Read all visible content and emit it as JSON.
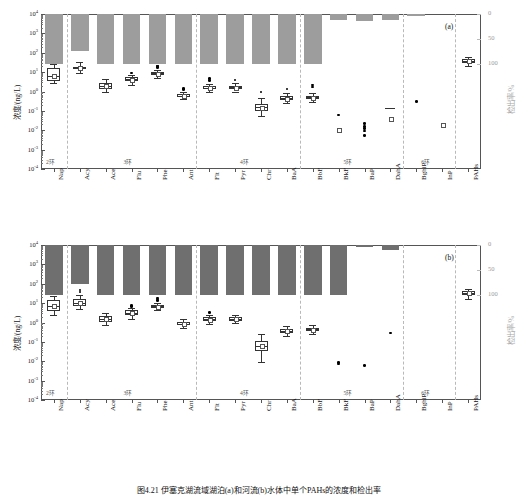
{
  "figure": {
    "caption": "图4.21  伊塞克湖流域湖泊(a)和河流(b)水体中单个PAHs的浓度和检出率",
    "panel_a_id": "(a)",
    "panel_b_id": "(b)"
  },
  "axes": {
    "left_title": "浓度/(ng/L)",
    "right_title": "检出率/%",
    "left_ticks": [
      "10",
      "10",
      "10",
      "10",
      "10",
      "10",
      "10",
      "10",
      "10"
    ],
    "left_exponents": [
      "4",
      "3",
      "2",
      "1",
      "0",
      "-1",
      "-2",
      "-3",
      "-4"
    ],
    "right_ticks": [
      "0",
      "50",
      "100"
    ],
    "right_values": [
      0,
      50,
      100
    ]
  },
  "groups": [
    {
      "label": "2环",
      "count": 1
    },
    {
      "label": "3环",
      "count": 5
    },
    {
      "label": "4环",
      "count": 4
    },
    {
      "label": "5环",
      "count": 4
    },
    {
      "label": "6环",
      "count": 2
    }
  ],
  "categories": [
    "Nap",
    "Acy",
    "Ace",
    "Flu",
    "Phe",
    "Ant",
    "Flt",
    "Pyr",
    "Chr",
    "BaA",
    "BbF",
    "BkF",
    "BaP",
    "DahA",
    "BghiP",
    "InP",
    "PAHs"
  ],
  "chart_data": [
    {
      "type": "bar",
      "panel": "(a)",
      "subject": "湖泊",
      "title": "伊塞克湖流域湖泊水体中单个PAHs的浓度和检出率",
      "xlabel": "",
      "ylabel": "浓度/(ng/L)",
      "y2label": "检出率/%",
      "ylim": [
        0.0001,
        10000
      ],
      "y2lim": [
        0,
        100
      ],
      "yscale": "log",
      "grid": false,
      "legend": "none",
      "categories": [
        "Nap",
        "Acy",
        "Ace",
        "Flu",
        "Phe",
        "Ant",
        "Flt",
        "Pyr",
        "Chr",
        "BaA",
        "BbF",
        "BkF",
        "BaP",
        "DahA",
        "BghiP",
        "InP",
        "PAHs"
      ],
      "series": [
        {
          "name": "检出率/%",
          "type": "bar",
          "values": [
            100,
            73,
            100,
            100,
            100,
            100,
            100,
            100,
            100,
            100,
            100,
            12,
            14,
            11,
            3,
            null,
            null
          ]
        },
        {
          "name": "浓度/(ng/L)",
          "type": "box",
          "boxes": [
            {
              "cat": "Nap",
              "min": 2.6,
              "q1": 3.6,
              "med": 6.2,
              "q3": 17.0,
              "max": 25.0,
              "mean": 7.0,
              "outliers": []
            },
            {
              "cat": "Acy",
              "min": 9.5,
              "q1": 14.0,
              "med": 16.0,
              "q3": 19.0,
              "max": 33.0,
              "mean": 16.5,
              "outliers": []
            },
            {
              "cat": "Ace",
              "min": 0.9,
              "q1": 1.4,
              "med": 1.9,
              "q3": 2.6,
              "max": 4.3,
              "mean": 2.0,
              "outliers": []
            },
            {
              "cat": "Flu",
              "min": 2.1,
              "q1": 3.3,
              "med": 4.3,
              "q3": 5.5,
              "max": 7.0,
              "mean": 4.4,
              "outliers": [
                9.0
              ]
            },
            {
              "cat": "Phe",
              "min": 5.0,
              "q1": 7.0,
              "med": 8.5,
              "q3": 10.5,
              "max": 13.0,
              "mean": 8.8,
              "outliers": [
                17.0,
                19.0,
                21.0
              ]
            },
            {
              "cat": "Ant",
              "min": 0.42,
              "q1": 0.52,
              "med": 0.62,
              "q3": 0.75,
              "max": 0.95,
              "mean": 0.63,
              "outliers": [
                1.25,
                1.45
              ]
            },
            {
              "cat": "Flt",
              "min": 0.95,
              "q1": 1.35,
              "med": 1.6,
              "q3": 1.95,
              "max": 2.5,
              "mean": 1.65,
              "outliers": [
                3.6,
                4.6
              ]
            },
            {
              "cat": "Pyr",
              "min": 1.0,
              "q1": 1.35,
              "med": 1.65,
              "q3": 2.0,
              "max": 2.6,
              "mean": 1.7,
              "outliers": [
                4.0
              ]
            },
            {
              "cat": "Chr",
              "min": 0.055,
              "q1": 0.1,
              "med": 0.15,
              "q3": 0.22,
              "max": 0.45,
              "mean": 0.15,
              "outliers": [
                0.95
              ]
            },
            {
              "cat": "BaA",
              "min": 0.25,
              "q1": 0.36,
              "med": 0.45,
              "q3": 0.58,
              "max": 0.8,
              "mean": 0.46,
              "outliers": [
                1.35
              ]
            },
            {
              "cat": "BbF",
              "min": 0.3,
              "q1": 0.42,
              "med": 0.5,
              "q3": 0.62,
              "max": 0.8,
              "mean": 0.52,
              "outliers": [
                1.7,
                2.2
              ]
            },
            {
              "cat": "BkF",
              "min": null,
              "q1": null,
              "med": null,
              "q3": null,
              "max": null,
              "mean": 0.0105,
              "outliers": [
                0.062
              ]
            },
            {
              "cat": "BaP",
              "min": null,
              "q1": null,
              "med": null,
              "q3": null,
              "max": null,
              "mean": null,
              "outliers": [
                0.022,
                0.016,
                0.012,
                0.009,
                0.0055
              ]
            },
            {
              "cat": "DahA",
              "min": null,
              "q1": null,
              "med": 0.135,
              "q3": null,
              "max": null,
              "mean": 0.042,
              "outliers": []
            },
            {
              "cat": "BghiP",
              "min": null,
              "q1": null,
              "med": null,
              "q3": null,
              "max": null,
              "mean": null,
              "outliers": [
                0.31
              ]
            },
            {
              "cat": "InP",
              "min": null,
              "q1": null,
              "med": null,
              "q3": null,
              "max": null,
              "mean": 0.021,
              "outliers": []
            },
            {
              "cat": "PAHs",
              "min": 20.0,
              "q1": 30.0,
              "med": 38.0,
              "q3": 48.0,
              "max": 62.0,
              "mean": 39.0,
              "outliers": []
            }
          ]
        }
      ]
    },
    {
      "type": "bar",
      "panel": "(b)",
      "subject": "河流",
      "title": "伊塞克湖流域河流水体中单个PAHs的浓度和检出率",
      "xlabel": "",
      "ylabel": "浓度/(ng/L)",
      "y2label": "检出率/%",
      "ylim": [
        0.0001,
        10000
      ],
      "y2lim": [
        0,
        100
      ],
      "yscale": "log",
      "grid": false,
      "legend": "none",
      "categories": [
        "Nap",
        "Acy",
        "Ace",
        "Flu",
        "Phe",
        "Ant",
        "Flt",
        "Pyr",
        "Chr",
        "BaA",
        "BbF",
        "BkF",
        "BaP",
        "DahA",
        "BghiP",
        "InP",
        "PAHs"
      ],
      "series": [
        {
          "name": "检出率/%",
          "type": "bar",
          "values": [
            100,
            78,
            100,
            100,
            100,
            100,
            100,
            100,
            100,
            100,
            100,
            100,
            4,
            10,
            null,
            null,
            null
          ]
        },
        {
          "name": "浓度/(ng/L)",
          "type": "box",
          "boxes": [
            {
              "cat": "Nap",
              "min": 2.3,
              "q1": 4.0,
              "med": 7.0,
              "q3": 14.0,
              "max": 22.0,
              "mean": 7.5,
              "outliers": []
            },
            {
              "cat": "Acy",
              "min": 5.0,
              "q1": 7.5,
              "med": 10.0,
              "q3": 16.0,
              "max": 26.0,
              "mean": 11.0,
              "outliers": [
                38.0,
                48.0
              ]
            },
            {
              "cat": "Ace",
              "min": 0.75,
              "q1": 1.1,
              "med": 1.5,
              "q3": 2.1,
              "max": 3.2,
              "mean": 1.55,
              "outliers": []
            },
            {
              "cat": "Flu",
              "min": 1.6,
              "q1": 2.5,
              "med": 3.2,
              "q3": 4.2,
              "max": 5.5,
              "mean": 3.3,
              "outliers": [
                6.8,
                7.6
              ]
            },
            {
              "cat": "Phe",
              "min": 4.3,
              "q1": 5.6,
              "med": 6.8,
              "q3": 8.2,
              "max": 10.0,
              "mean": 7.0,
              "outliers": [
                14.0,
                16.0,
                18.0
              ]
            },
            {
              "cat": "Ant",
              "min": 0.5,
              "q1": 0.7,
              "med": 0.88,
              "q3": 1.1,
              "max": 1.45,
              "mean": 0.9,
              "outliers": []
            },
            {
              "cat": "Flt",
              "min": 0.85,
              "q1": 1.15,
              "med": 1.45,
              "q3": 1.85,
              "max": 2.4,
              "mean": 1.5,
              "outliers": [
                3.2
              ]
            },
            {
              "cat": "Pyr",
              "min": 0.95,
              "q1": 1.25,
              "med": 1.55,
              "q3": 1.95,
              "max": 2.5,
              "mean": 1.6,
              "outliers": []
            },
            {
              "cat": "Chr",
              "min": 0.009,
              "q1": 0.035,
              "med": 0.06,
              "q3": 0.11,
              "max": 0.26,
              "mean": 0.065,
              "outliers": []
            },
            {
              "cat": "BaA",
              "min": 0.2,
              "q1": 0.3,
              "med": 0.38,
              "q3": 0.48,
              "max": 0.68,
              "mean": 0.39,
              "outliers": []
            },
            {
              "cat": "BbF",
              "min": 0.25,
              "q1": 0.35,
              "med": 0.44,
              "q3": 0.55,
              "max": 0.75,
              "mean": 0.45,
              "outliers": []
            },
            {
              "cat": "BkF",
              "min": null,
              "q1": null,
              "med": null,
              "q3": null,
              "max": null,
              "mean": null,
              "outliers": [
                0.0088,
                0.0072
              ]
            },
            {
              "cat": "BaP",
              "min": null,
              "q1": null,
              "med": null,
              "q3": null,
              "max": null,
              "mean": null,
              "outliers": [
                0.006
              ]
            },
            {
              "cat": "DahA",
              "min": null,
              "q1": null,
              "med": null,
              "q3": null,
              "max": null,
              "mean": null,
              "outliers": [
                0.29
              ]
            },
            {
              "cat": "BghiP",
              "min": null,
              "q1": null,
              "med": null,
              "q3": null,
              "max": null,
              "mean": null,
              "outliers": []
            },
            {
              "cat": "InP",
              "min": null,
              "q1": null,
              "med": null,
              "q3": null,
              "max": null,
              "mean": null,
              "outliers": []
            },
            {
              "cat": "PAHs",
              "min": 16.0,
              "q1": 26.0,
              "med": 33.0,
              "q3": 42.0,
              "max": 56.0,
              "mean": 34.0,
              "outliers": []
            }
          ]
        }
      ]
    }
  ]
}
